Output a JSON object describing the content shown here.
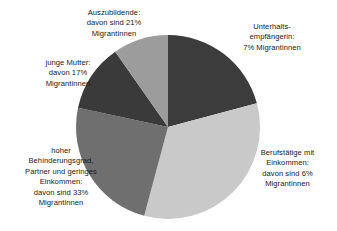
{
  "chart_data": {
    "type": "pie",
    "title": "",
    "subtitle": "",
    "xlabel": "",
    "ylabel": "",
    "legend_position": "none",
    "grid": false,
    "labels_placement": "outside-callout",
    "start_angle_deg": 0,
    "direction": "clockwise",
    "categories": [
      "Unterhaltsempfängerin",
      "Berufstätige mit Einkommen",
      "hoher Behinderungsgrad, Partner und geringes Einkommen",
      "junge Mutter",
      "Auszubildende"
    ],
    "values": [
      20.8,
      33.3,
      24.2,
      12.0,
      9.7
    ],
    "value_unit": "percent of circle",
    "annotation_values": [
      7,
      6,
      33,
      17,
      21
    ],
    "annotation_unit": "% Migrantinnen",
    "colors": [
      "#3c3c3c",
      "#c9c9c9",
      "#6f6f6f",
      "#3a3a3a",
      "#9c9c9c"
    ],
    "slices": [
      {
        "name": "Unterhaltsempfängerin",
        "share": 20.8,
        "start_deg": 0,
        "end_deg": 75,
        "color": "#3c3c3c",
        "migrantinnen_percent": 7,
        "label_lines": [
          "Unterhalts-",
          "empfängerin:",
          "7% Migrantinnen"
        ]
      },
      {
        "name": "Berufstätige mit Einkommen",
        "share": 33.3,
        "start_deg": 75,
        "end_deg": 195,
        "color": "#c9c9c9",
        "migrantinnen_percent": 6,
        "label_lines": [
          "Berufstätige mit",
          "Einkommen:",
          "davon sind 6%",
          "Migrantinnen"
        ]
      },
      {
        "name": "hoher Behinderungsgrad, Partner und geringes Einkommen",
        "share": 24.2,
        "start_deg": 195,
        "end_deg": 282,
        "color": "#6f6f6f",
        "migrantinnen_percent": 33,
        "label_lines": [
          "hoher",
          "Behinderungsgrad,",
          "Partner und geringes",
          "Einkommen:",
          "davon sind 33%",
          "Migrantinnen"
        ]
      },
      {
        "name": "junge Mutter",
        "share": 12.0,
        "start_deg": 282,
        "end_deg": 325,
        "color": "#3a3a3a",
        "migrantinnen_percent": 17,
        "label_lines": [
          "junge Mutter:",
          "davon 17%",
          "Migrantinnen"
        ]
      },
      {
        "name": "Auszubildende",
        "share": 9.7,
        "start_deg": 325,
        "end_deg": 360,
        "color": "#9c9c9c",
        "migrantinnen_percent": 21,
        "label_lines": [
          "Auszubildende:",
          "davon sind 21%",
          "Migrantinnen"
        ]
      }
    ]
  },
  "labels": {
    "auszubildende": "Auszubildende:\ndavon sind 21%\nMigrantinnen",
    "unterhalt": "Unterhalts-\nempfängerin:\n7% Migrantinnen",
    "junge_mutter": "junge Mutter:\ndavon 17%\nMigrantinnen",
    "behinderung": "hoher\nBehinderungsgrad,\nPartner und geringes\nEinkommen:\ndavon sind 33%\nMigrantinnen",
    "berufstaetige": "Berufstätige mit\nEinkommen:\ndavon sind 6%\nMigrantinnen"
  },
  "geometry": {
    "center_x": 168,
    "center_y": 127,
    "radius": 92
  }
}
